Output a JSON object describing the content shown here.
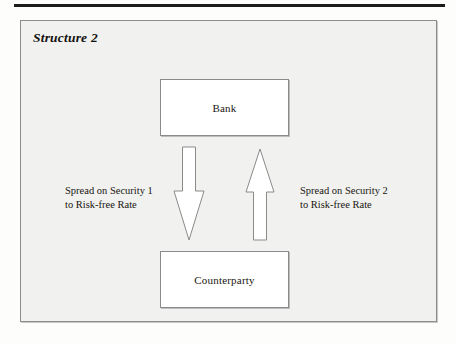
{
  "figure": {
    "title": "Structure 2",
    "entities": [
      {
        "id": "bank",
        "label": "Bank"
      },
      {
        "id": "counterparty",
        "label": "Counterparty"
      }
    ],
    "flows": [
      {
        "id": "bank-to-counterparty",
        "direction": "down",
        "caption_line1": "Spread on Security 1",
        "caption_line2": "to Risk-free Rate"
      },
      {
        "id": "counterparty-to-bank",
        "direction": "up",
        "caption_line1": "Spread on Security 2",
        "caption_line2": "to Risk-free Rate"
      }
    ]
  },
  "colors": {
    "page_background": "#fdfdfc",
    "figure_background": "#f1f1ef",
    "frame_border": "#8d8d8d",
    "box_fill": "#ffffff",
    "box_border": "#8a8a8a",
    "text": "#18160f",
    "rule": "#1c1c1c"
  }
}
